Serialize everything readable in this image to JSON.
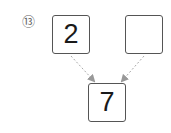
{
  "problem": {
    "number_label": "⑬",
    "top_left_value": "2",
    "top_right_value": "",
    "bottom_value": "7"
  },
  "colors": {
    "box_border": "#555555",
    "arrow": "#aaaaaa",
    "text": "#1a1a1a"
  }
}
